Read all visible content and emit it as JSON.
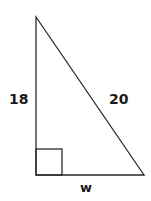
{
  "diagram": {
    "type": "right-triangle",
    "stroke_color": "#2a2a2a",
    "background": "#ffffff",
    "vertices": {
      "top": [
        36,
        17
      ],
      "right_angle": [
        36,
        175
      ],
      "bottom_right": [
        144,
        175
      ]
    },
    "right_angle_marker": {
      "x": 36,
      "y": 149,
      "size": 26
    },
    "labels": {
      "vertical_leg": "18",
      "hypotenuse": "20",
      "horizontal_leg": "w"
    }
  }
}
